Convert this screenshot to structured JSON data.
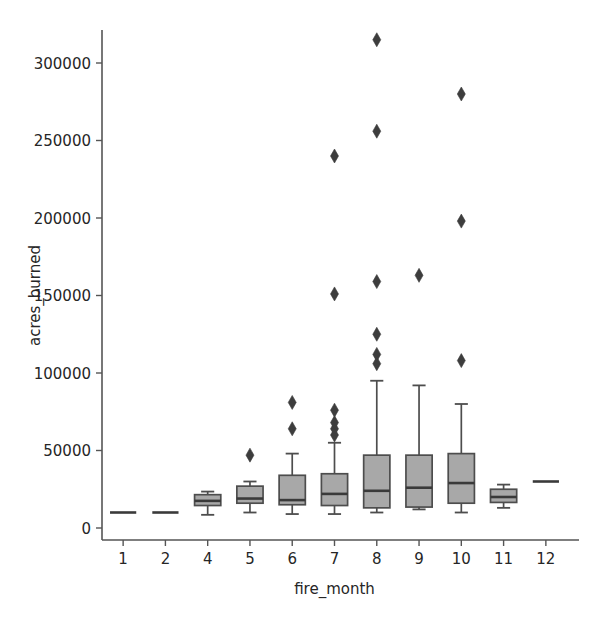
{
  "chart_data": {
    "type": "box",
    "title": "",
    "xlabel": "fire_month",
    "ylabel": "acres_burned",
    "categories": [
      "1",
      "2",
      "4",
      "5",
      "6",
      "7",
      "8",
      "9",
      "10",
      "11",
      "12"
    ],
    "ytick_labels": [
      "0",
      "50000",
      "100000",
      "150000",
      "200000",
      "250000",
      "300000"
    ],
    "ytick_values": [
      0,
      50000,
      100000,
      150000,
      200000,
      250000,
      300000
    ],
    "ylim": [
      -8000,
      330000
    ],
    "grid": false,
    "legend": null,
    "box_fill_color": "#a8a8a8",
    "box_edge_color": "#4d4d4d",
    "flier_color": "#3d3d3d",
    "flier_marker": "diamond",
    "boxes": [
      {
        "category": "1",
        "whisker_low": 10000,
        "q1": 10000,
        "median": 10000,
        "q3": 10000,
        "whisker_high": 10000,
        "fliers": []
      },
      {
        "category": "2",
        "whisker_low": 10000,
        "q1": 10000,
        "median": 10000,
        "q3": 10000,
        "whisker_high": 10000,
        "fliers": []
      },
      {
        "category": "4",
        "whisker_low": 8500,
        "q1": 14500,
        "median": 17500,
        "q3": 21500,
        "whisker_high": 23500,
        "fliers": []
      },
      {
        "category": "5",
        "whisker_low": 10000,
        "q1": 16000,
        "median": 19000,
        "q3": 27000,
        "whisker_high": 30000,
        "fliers": [
          47000
        ]
      },
      {
        "category": "6",
        "whisker_low": 9000,
        "q1": 15000,
        "median": 18000,
        "q3": 34000,
        "whisker_high": 48000,
        "fliers": [
          64000,
          81000
        ]
      },
      {
        "category": "7",
        "whisker_low": 9000,
        "q1": 14500,
        "median": 22000,
        "q3": 35000,
        "whisker_high": 55000,
        "fliers": [
          60000,
          64000,
          68000,
          76000,
          151000,
          240000
        ]
      },
      {
        "category": "8",
        "whisker_low": 10000,
        "q1": 13000,
        "median": 24000,
        "q3": 47000,
        "whisker_high": 95000,
        "fliers": [
          106000,
          112000,
          125000,
          159000,
          256000,
          315000
        ]
      },
      {
        "category": "9",
        "whisker_low": 12000,
        "q1": 13500,
        "median": 26000,
        "q3": 47000,
        "whisker_high": 92000,
        "fliers": [
          163000
        ]
      },
      {
        "category": "10",
        "whisker_low": 10000,
        "q1": 16000,
        "median": 29000,
        "q3": 48000,
        "whisker_high": 80000,
        "fliers": [
          108000,
          198000,
          280000
        ]
      },
      {
        "category": "11",
        "whisker_low": 13000,
        "q1": 16500,
        "median": 20000,
        "q3": 25000,
        "whisker_high": 28000,
        "fliers": []
      },
      {
        "category": "12",
        "whisker_low": 30000,
        "q1": 30000,
        "median": 30000,
        "q3": 30000,
        "whisker_high": 30000,
        "fliers": []
      }
    ]
  }
}
